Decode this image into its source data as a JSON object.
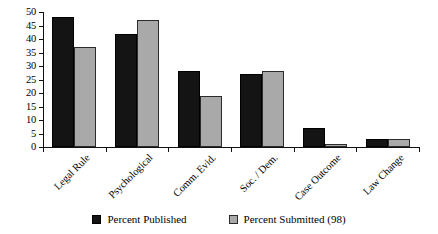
{
  "chart_data": {
    "type": "bar",
    "title": "",
    "subtitle": "",
    "xlabel": "",
    "ylabel": "",
    "ylim": [
      0,
      50
    ],
    "yticks": [
      0,
      5,
      10,
      15,
      20,
      25,
      30,
      35,
      40,
      45,
      50
    ],
    "grid": false,
    "legend_position": "bottom",
    "categories": [
      "Legal Rule",
      "Psychological",
      "Comm. Evid.",
      "Soc. / Dem.",
      "Case Outcome",
      "Law Change"
    ],
    "series": [
      {
        "name": "Percent Published",
        "color": "#141414",
        "values": [
          48,
          42,
          28,
          27,
          7,
          3
        ]
      },
      {
        "name": "Percent Submitted (98)",
        "color": "#a9a9a9",
        "values": [
          37,
          47,
          19,
          28,
          1,
          3
        ]
      }
    ]
  },
  "legend": {
    "items": [
      {
        "label": "Percent Published"
      },
      {
        "label": "Percent Submitted (98)"
      }
    ]
  }
}
